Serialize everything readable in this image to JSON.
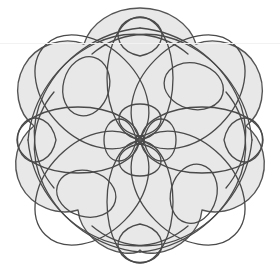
{
  "artwork": {
    "title": "Decorative Continuous-Line Loop Motif",
    "description": "Four-fold symmetric spirograph-style quilting motif on a scalloped gray medallion",
    "symmetry_order": 4,
    "canvas": {
      "width": 280,
      "height": 280
    },
    "center": {
      "x": 140,
      "y": 140
    },
    "colors": {
      "page_background": "#ffffff",
      "medallion_fill": "#e8e8e8",
      "medallion_stroke": "#555555",
      "line_stroke": "#4a4a4a",
      "scan_line": "#f2f2f2"
    },
    "stroke_widths": {
      "medallion": 1.4,
      "curve": 1.3
    }
  },
  "medallion": {
    "name": "scalloped-medallion",
    "scallop_count": 8,
    "outer_radius": 132,
    "inner_radius": 118,
    "notch_angles_deg": [
      22,
      67,
      112,
      157,
      202,
      247,
      292,
      337
    ]
  },
  "elements": {
    "edge_teardrops": {
      "label": "Small teardrop loops at cardinal edges",
      "count": 4,
      "positions_deg": [
        90,
        0,
        270,
        180
      ],
      "radius_from_center": 110,
      "loop_rx": 17,
      "loop_ry": 22
    },
    "petal_ovals": {
      "label": "Large inner petal ovals",
      "count": 4,
      "angles_deg": [
        45,
        135,
        225,
        315
      ],
      "rx": 34,
      "ry": 62
    },
    "corner_loops": {
      "label": "Mid-size diagonal corner loops",
      "count": 4,
      "angles_deg": [
        45,
        135,
        225,
        315
      ],
      "radius_from_center": 78,
      "loop_rx": 30,
      "loop_ry": 24
    },
    "center_rosette": {
      "label": "Central four-petal rosette",
      "petal_count": 4,
      "petal_length": 34,
      "petal_width": 22,
      "hub_size": 7
    }
  },
  "scan_artifacts": {
    "faint_horizontal_line_y": 43
  },
  "annotations": {
    "overlay_label": "",
    "caption": ""
  }
}
